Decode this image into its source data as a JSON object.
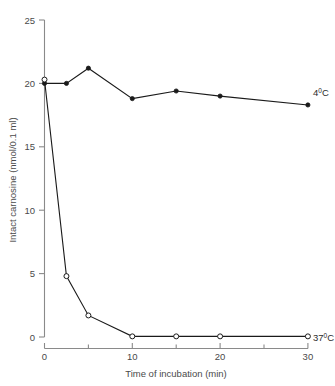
{
  "chart_data": {
    "type": "line",
    "title": "",
    "xlabel": "Time of incubation (min)",
    "ylabel": "Intact carnosine (nmol/0.1 ml)",
    "xlim": [
      0,
      30
    ],
    "ylim": [
      0,
      25
    ],
    "xticks": [
      0,
      5,
      10,
      15,
      20,
      25,
      30
    ],
    "xtick_labels": [
      "0",
      "",
      "10",
      "",
      "20",
      "",
      "30"
    ],
    "yticks": [
      0,
      5,
      10,
      15,
      20,
      25
    ],
    "ytick_labels": [
      "0",
      "5",
      "10",
      "15",
      "20",
      "25"
    ],
    "grid": false,
    "legend_position": "inline-right",
    "series": [
      {
        "name": "4⁰0C",
        "label": "4",
        "label_sup": "0",
        "label_unit": "C",
        "marker": "filled-circle",
        "color": "#1a1a1a",
        "x": [
          0,
          2.5,
          5,
          10,
          15,
          20,
          30
        ],
        "values": [
          20.0,
          20.0,
          21.2,
          18.8,
          19.4,
          19.0,
          18.3
        ]
      },
      {
        "name": "37⁰0C",
        "label": "37",
        "label_sup": "0",
        "label_unit": "C",
        "marker": "open-circle",
        "color": "#1a1a1a",
        "x": [
          0,
          2.5,
          5,
          10,
          15,
          20,
          30
        ],
        "values": [
          20.3,
          4.8,
          1.7,
          0.05,
          0.05,
          0.05,
          0.05
        ]
      }
    ]
  },
  "axes": {
    "y_tick_labels": [
      "25",
      "20",
      "15",
      "10",
      "5",
      "0"
    ],
    "x_tick_labels": [
      "0",
      "10",
      "20",
      "30"
    ],
    "x_title": "Time of incubation (min)",
    "y_title": "Intact carnosine (nmol/0.1 ml)"
  },
  "colors": {
    "axis": "#8a8a8a",
    "data": "#1a1a1a",
    "text": "#4a4a4a",
    "background": "#ffffff"
  }
}
